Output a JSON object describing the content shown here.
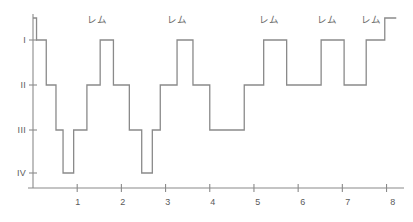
{
  "chart_data": {
    "type": "line",
    "title": "",
    "subtitle": "",
    "xlabel": "",
    "ylabel": "",
    "xlim": [
      0,
      8.35
    ],
    "ylim_stages": [
      "Awake",
      "I",
      "II",
      "III",
      "IV"
    ],
    "grid": false,
    "legend": null,
    "x_ticks": [
      "1",
      "2",
      "3",
      "4",
      "5",
      "6",
      "7",
      "8"
    ],
    "x_tick_values": [
      1,
      2,
      3,
      4,
      5,
      6,
      7,
      8
    ],
    "y_ticks": [
      "I",
      "II",
      "III",
      "IV"
    ],
    "y_tick_values": [
      1,
      2,
      3,
      4
    ],
    "series": [
      {
        "name": "sleep-stage",
        "step": "post",
        "color": "#8a8a8a",
        "points": [
          {
            "x": 0.0,
            "stage": 0
          },
          {
            "x": 0.08,
            "stage": 0
          },
          {
            "x": 0.08,
            "stage": 1
          },
          {
            "x": 0.3,
            "stage": 1
          },
          {
            "x": 0.3,
            "stage": 2
          },
          {
            "x": 0.52,
            "stage": 2
          },
          {
            "x": 0.52,
            "stage": 3
          },
          {
            "x": 0.68,
            "stage": 3
          },
          {
            "x": 0.68,
            "stage": 4
          },
          {
            "x": 0.92,
            "stage": 4
          },
          {
            "x": 0.92,
            "stage": 3
          },
          {
            "x": 1.22,
            "stage": 3
          },
          {
            "x": 1.22,
            "stage": 2
          },
          {
            "x": 1.52,
            "stage": 2
          },
          {
            "x": 1.52,
            "stage": 1
          },
          {
            "x": 1.82,
            "stage": 1
          },
          {
            "x": 1.82,
            "stage": 2
          },
          {
            "x": 2.18,
            "stage": 2
          },
          {
            "x": 2.18,
            "stage": 3
          },
          {
            "x": 2.46,
            "stage": 3
          },
          {
            "x": 2.46,
            "stage": 4
          },
          {
            "x": 2.7,
            "stage": 4
          },
          {
            "x": 2.7,
            "stage": 3
          },
          {
            "x": 2.88,
            "stage": 3
          },
          {
            "x": 2.88,
            "stage": 2
          },
          {
            "x": 3.26,
            "stage": 2
          },
          {
            "x": 3.26,
            "stage": 1
          },
          {
            "x": 3.62,
            "stage": 1
          },
          {
            "x": 3.62,
            "stage": 2
          },
          {
            "x": 4.0,
            "stage": 2
          },
          {
            "x": 4.0,
            "stage": 3
          },
          {
            "x": 4.78,
            "stage": 3
          },
          {
            "x": 4.78,
            "stage": 2
          },
          {
            "x": 5.22,
            "stage": 2
          },
          {
            "x": 5.22,
            "stage": 1
          },
          {
            "x": 5.74,
            "stage": 1
          },
          {
            "x": 5.74,
            "stage": 2
          },
          {
            "x": 6.52,
            "stage": 2
          },
          {
            "x": 6.52,
            "stage": 1
          },
          {
            "x": 7.04,
            "stage": 1
          },
          {
            "x": 7.04,
            "stage": 2
          },
          {
            "x": 7.54,
            "stage": 2
          },
          {
            "x": 7.54,
            "stage": 1
          },
          {
            "x": 7.96,
            "stage": 1
          },
          {
            "x": 7.96,
            "stage": 0
          },
          {
            "x": 8.22,
            "stage": 0
          }
        ]
      }
    ],
    "annotations": [
      {
        "label": "レム",
        "x": 1.67
      },
      {
        "label": "レム",
        "x": 3.44
      },
      {
        "label": "レム",
        "x": 5.48
      },
      {
        "label": "レム",
        "x": 6.78
      },
      {
        "label": "レム",
        "x": 7.75
      }
    ],
    "axis_color": "#8a8a8a",
    "line_color": "#8a8a8a",
    "text_color": "#5a5a5a",
    "background": "#ffffff"
  },
  "y_axis": {
    "labels": [
      {
        "text": "I",
        "top": 36
      },
      {
        "text": "II",
        "top": 81
      },
      {
        "text": "III",
        "top": 126
      },
      {
        "text": "IV",
        "top": 169
      }
    ]
  },
  "x_axis": {
    "labels": [
      {
        "text": "1",
        "left": 78
      },
      {
        "text": "2",
        "left": 123
      },
      {
        "text": "3",
        "left": 168
      },
      {
        "text": "4",
        "left": 213
      },
      {
        "text": "5",
        "left": 258
      },
      {
        "text": "6",
        "left": 303
      },
      {
        "text": "7",
        "left": 348
      },
      {
        "text": "8",
        "left": 393
      }
    ]
  },
  "rem_labels": [
    {
      "text": "レム",
      "left": 97
    },
    {
      "text": "レム",
      "left": 177
    },
    {
      "text": "レム",
      "left": 269
    },
    {
      "text": "レム",
      "left": 327
    },
    {
      "text": "レム",
      "left": 371
    }
  ]
}
